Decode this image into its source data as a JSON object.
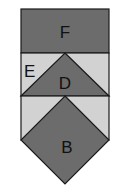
{
  "diagram": {
    "type": "quilt-block-shapes",
    "colors": {
      "dark": "#6c6c6c",
      "light": "#d2d2d2",
      "stroke": "#1a1a1a",
      "background": "#ffffff"
    },
    "shapes": [
      {
        "id": "F",
        "label": "F",
        "shape": "rectangle",
        "fill": "dark"
      },
      {
        "id": "E",
        "label": "E",
        "shape": "right-triangle-pair",
        "fill": "light"
      },
      {
        "id": "D",
        "label": "D",
        "shape": "isosceles-triangle",
        "fill": "dark"
      },
      {
        "id": "light-band-2",
        "label": "",
        "shape": "right-triangle-pair",
        "fill": "light"
      },
      {
        "id": "B",
        "label": "B",
        "shape": "square-diamond",
        "fill": "dark"
      }
    ]
  }
}
